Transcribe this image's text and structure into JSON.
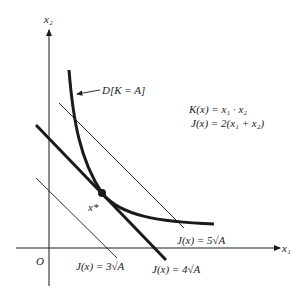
{
  "axes": {
    "x_label": "x₁",
    "y_label": "x₂",
    "origin_label": "O"
  },
  "curve_label": "D[K = A]",
  "equations": {
    "k": "K(x) = x₁ · x₂",
    "j": "J(x) = 2(x₁ + x₂)"
  },
  "optimum_label": "x*",
  "level_labels": {
    "j3": "J(x) = 3√A",
    "j4": "J(x) = 4√A",
    "j5": "J(x) = 5√A"
  },
  "colors": {
    "ink": "#1a1a1a"
  }
}
